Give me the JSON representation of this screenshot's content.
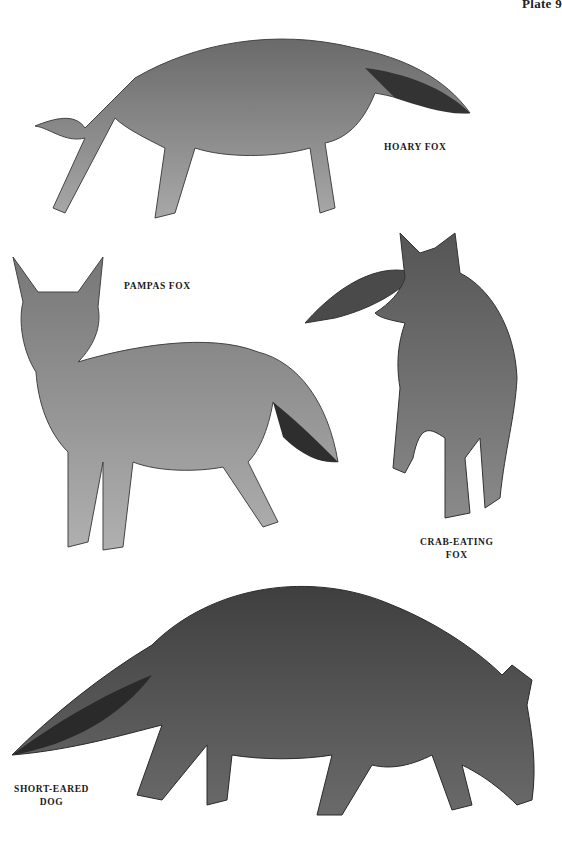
{
  "plate": {
    "header": "Plate 9"
  },
  "species": [
    {
      "id": "hoary-fox",
      "label_line1": "HOARY FOX",
      "label_line2": ""
    },
    {
      "id": "pampas-fox",
      "label_line1": "PAMPAS FOX",
      "label_line2": ""
    },
    {
      "id": "crab-eating-fox",
      "label_line1": "CRAB-EATING",
      "label_line2": "FOX"
    },
    {
      "id": "short-eared-dog",
      "label_line1": "SHORT-EARED",
      "label_line2": "DOG"
    }
  ],
  "colors": {
    "background": "#ffffff",
    "ink": "#1a1a1a",
    "fur_light": "#9a9a9a",
    "fur_mid": "#6e6e6e",
    "fur_dark": "#3a3a3a"
  }
}
